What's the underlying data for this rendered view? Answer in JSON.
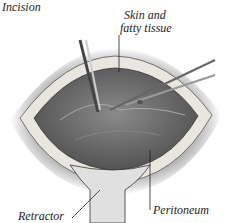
{
  "figure": {
    "type": "surgical illustration",
    "labels": {
      "incision": "Incision",
      "skin_line1": "Skin and",
      "skin_line2": "fatty tissue",
      "peritoneum": "Peritoneum",
      "retractor": "Retractor"
    },
    "colors": {
      "cavity": "#6e6e6e",
      "fat_layer": "#e8e6df",
      "skin_shadow": "#9a9a9a",
      "retractor": "#d9d9d9",
      "instrument": "#bdbdbd"
    }
  }
}
